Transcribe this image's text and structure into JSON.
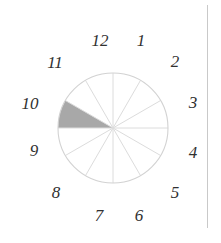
{
  "figure": {
    "kind": "clock-sector-diagram",
    "background_color": "#ffffff"
  },
  "clock": {
    "center": {
      "x": 113,
      "y": 128
    },
    "radius": 55,
    "sector_count": 12,
    "outline_color": "#d2d2d2",
    "spoke_color": "#dcdcdc",
    "shaded_sector_color": "#a8a8a8",
    "shaded_sector": {
      "label": "shaded-wedge-8-to-9",
      "from_hour": 9,
      "to_hour": 8,
      "start_angle_deg": 180,
      "end_angle_deg": 210
    },
    "hour_labels": [
      {
        "hour": "12",
        "x": 100,
        "y": 40
      },
      {
        "hour": "1",
        "x": 141,
        "y": 40
      },
      {
        "hour": "2",
        "x": 175,
        "y": 61
      },
      {
        "hour": "3",
        "x": 193,
        "y": 102
      },
      {
        "hour": "4",
        "x": 193,
        "y": 152
      },
      {
        "hour": "5",
        "x": 175,
        "y": 192
      },
      {
        "hour": "6",
        "x": 139,
        "y": 215
      },
      {
        "hour": "7",
        "x": 99,
        "y": 215
      },
      {
        "hour": "8",
        "x": 56,
        "y": 192
      },
      {
        "hour": "9",
        "x": 34,
        "y": 150
      },
      {
        "hour": "10",
        "x": 30,
        "y": 103
      },
      {
        "hour": "11",
        "x": 55,
        "y": 62
      }
    ]
  },
  "page_rule": {
    "name": "page-column-rule",
    "color": "#c9c9c9"
  }
}
